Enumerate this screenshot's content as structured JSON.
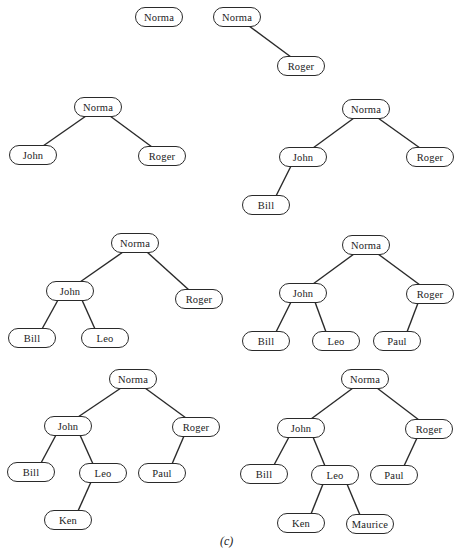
{
  "caption": "(c)",
  "colors": {
    "stroke": "#2a2a2a",
    "background": "#ffffff",
    "text": "#222222"
  },
  "trees": [
    {
      "id": "step1",
      "nodes": [
        {
          "label": "Norma",
          "x": 135,
          "y": 7
        }
      ],
      "edges": []
    },
    {
      "id": "step2",
      "nodes": [
        {
          "label": "Norma",
          "x": 213,
          "y": 7
        },
        {
          "label": "Roger",
          "x": 277,
          "y": 56
        }
      ],
      "edges": [
        [
          0,
          1
        ]
      ]
    },
    {
      "id": "step3",
      "nodes": [
        {
          "label": "Norma",
          "x": 74,
          "y": 97
        },
        {
          "label": "John",
          "x": 9,
          "y": 145
        },
        {
          "label": "Roger",
          "x": 138,
          "y": 146
        }
      ],
      "edges": [
        [
          0,
          1
        ],
        [
          0,
          2
        ]
      ]
    },
    {
      "id": "step4",
      "nodes": [
        {
          "label": "Norma",
          "x": 342,
          "y": 99
        },
        {
          "label": "John",
          "x": 279,
          "y": 147
        },
        {
          "label": "Roger",
          "x": 406,
          "y": 147
        },
        {
          "label": "Bill",
          "x": 242,
          "y": 195
        }
      ],
      "edges": [
        [
          0,
          1
        ],
        [
          0,
          2
        ],
        [
          1,
          3
        ]
      ]
    },
    {
      "id": "step5",
      "nodes": [
        {
          "label": "Norma",
          "x": 111,
          "y": 233
        },
        {
          "label": "John",
          "x": 46,
          "y": 281
        },
        {
          "label": "Roger",
          "x": 175,
          "y": 289
        },
        {
          "label": "Bill",
          "x": 8,
          "y": 328
        },
        {
          "label": "Leo",
          "x": 81,
          "y": 328
        }
      ],
      "edges": [
        [
          0,
          1
        ],
        [
          0,
          2
        ],
        [
          1,
          3
        ],
        [
          1,
          4
        ]
      ]
    },
    {
      "id": "step6",
      "nodes": [
        {
          "label": "Norma",
          "x": 342,
          "y": 235
        },
        {
          "label": "John",
          "x": 279,
          "y": 283
        },
        {
          "label": "Roger",
          "x": 406,
          "y": 284
        },
        {
          "label": "Bill",
          "x": 242,
          "y": 331
        },
        {
          "label": "Leo",
          "x": 312,
          "y": 331
        },
        {
          "label": "Paul",
          "x": 373,
          "y": 331
        }
      ],
      "edges": [
        [
          0,
          1
        ],
        [
          0,
          2
        ],
        [
          1,
          3
        ],
        [
          1,
          4
        ],
        [
          2,
          5
        ]
      ]
    },
    {
      "id": "step7",
      "nodes": [
        {
          "label": "Norma",
          "x": 109,
          "y": 369
        },
        {
          "label": "John",
          "x": 44,
          "y": 416
        },
        {
          "label": "Roger",
          "x": 172,
          "y": 417
        },
        {
          "label": "Bill",
          "x": 7,
          "y": 462
        },
        {
          "label": "Leo",
          "x": 79,
          "y": 463
        },
        {
          "label": "Paul",
          "x": 138,
          "y": 463
        },
        {
          "label": "Ken",
          "x": 44,
          "y": 510
        }
      ],
      "edges": [
        [
          0,
          1
        ],
        [
          0,
          2
        ],
        [
          1,
          3
        ],
        [
          1,
          4
        ],
        [
          2,
          5
        ],
        [
          4,
          6
        ]
      ]
    },
    {
      "id": "step8",
      "nodes": [
        {
          "label": "Norma",
          "x": 341,
          "y": 369
        },
        {
          "label": "John",
          "x": 277,
          "y": 418
        },
        {
          "label": "Roger",
          "x": 405,
          "y": 419
        },
        {
          "label": "Bill",
          "x": 240,
          "y": 464
        },
        {
          "label": "Leo",
          "x": 311,
          "y": 465
        },
        {
          "label": "Paul",
          "x": 370,
          "y": 465
        },
        {
          "label": "Ken",
          "x": 277,
          "y": 513
        },
        {
          "label": "Maurice",
          "x": 346,
          "y": 514
        }
      ],
      "edges": [
        [
          0,
          1
        ],
        [
          0,
          2
        ],
        [
          1,
          3
        ],
        [
          1,
          4
        ],
        [
          2,
          5
        ],
        [
          4,
          6
        ],
        [
          4,
          7
        ]
      ]
    }
  ]
}
